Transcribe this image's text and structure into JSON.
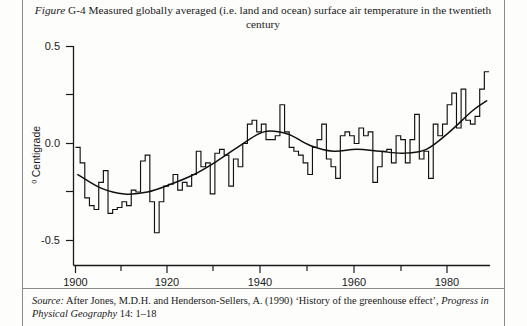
{
  "figure": {
    "label_italic": "Figure",
    "number": "G-4",
    "caption": "Measured globally averaged (i.e. land and ocean) surface air temperature in the twentieth century"
  },
  "source": {
    "lead": "Source:",
    "text_before_journal": " After Jones, M.D.H. and Henderson-Sellers, A. (1990) ‘History of the greenhouse effect’,",
    "journal": "Progress in Physical Geography",
    "text_after_journal": " 14: 1–18"
  },
  "chart_data": {
    "type": "line",
    "title": "Measured globally averaged (i.e. land and ocean) surface air temperature in the twentieth century",
    "xlabel": "",
    "ylabel": "⁰ Centigrade",
    "xlim": [
      1900,
      1989
    ],
    "ylim": [
      -0.6,
      0.5
    ],
    "grid": false,
    "legend": false,
    "x_ticks": [
      1900,
      1920,
      1940,
      1960,
      1980
    ],
    "x_tick_labels": [
      "1900",
      "1920",
      "1940",
      "1960",
      "1980"
    ],
    "x_minor_ticks": [
      1910,
      1930,
      1950,
      1970
    ],
    "y_ticks": [
      -0.5,
      0.0,
      0.5
    ],
    "y_tick_labels": [
      "-0.5",
      "0.0",
      "0.5"
    ],
    "y_minor_ticks": [
      -0.25,
      0.25
    ],
    "series": [
      {
        "name": "Annual mean temperature anomaly",
        "style": "step",
        "x": [
          1900,
          1901,
          1902,
          1903,
          1904,
          1905,
          1906,
          1907,
          1908,
          1909,
          1910,
          1911,
          1912,
          1913,
          1914,
          1915,
          1916,
          1917,
          1918,
          1919,
          1920,
          1921,
          1922,
          1923,
          1924,
          1925,
          1926,
          1927,
          1928,
          1929,
          1930,
          1931,
          1932,
          1933,
          1934,
          1935,
          1936,
          1937,
          1938,
          1939,
          1940,
          1941,
          1942,
          1943,
          1944,
          1945,
          1946,
          1947,
          1948,
          1949,
          1950,
          1951,
          1952,
          1953,
          1954,
          1955,
          1956,
          1957,
          1958,
          1959,
          1960,
          1961,
          1962,
          1963,
          1964,
          1965,
          1966,
          1967,
          1968,
          1969,
          1970,
          1971,
          1972,
          1973,
          1974,
          1975,
          1976,
          1977,
          1978,
          1979,
          1980,
          1981,
          1982,
          1983,
          1984,
          1985,
          1986,
          1987,
          1988
        ],
        "values": [
          -0.02,
          -0.1,
          -0.28,
          -0.32,
          -0.34,
          -0.2,
          -0.14,
          -0.36,
          -0.34,
          -0.33,
          -0.3,
          -0.32,
          -0.24,
          -0.25,
          -0.09,
          -0.06,
          -0.3,
          -0.46,
          -0.3,
          -0.22,
          -0.21,
          -0.16,
          -0.24,
          -0.2,
          -0.22,
          -0.16,
          -0.04,
          -0.12,
          -0.1,
          -0.26,
          -0.05,
          -0.03,
          -0.06,
          -0.22,
          -0.08,
          -0.12,
          0.0,
          0.1,
          0.12,
          0.06,
          0.1,
          0.02,
          0.02,
          0.04,
          0.2,
          0.06,
          -0.02,
          -0.04,
          -0.06,
          -0.1,
          -0.16,
          -0.02,
          0.02,
          0.1,
          -0.08,
          -0.12,
          -0.18,
          0.04,
          0.06,
          0.04,
          0.0,
          0.08,
          0.04,
          0.06,
          -0.2,
          -0.12,
          -0.04,
          -0.03,
          -0.1,
          0.04,
          0.02,
          -0.1,
          0.02,
          0.15,
          -0.08,
          -0.04,
          -0.18,
          0.1,
          0.04,
          0.1,
          0.2,
          0.26,
          0.08,
          0.28,
          0.12,
          0.1,
          0.14,
          0.28,
          0.37
        ]
      },
      {
        "name": "Smoothed trend",
        "style": "smooth",
        "x": [
          1900,
          1905,
          1910,
          1915,
          1920,
          1925,
          1930,
          1935,
          1940,
          1945,
          1950,
          1955,
          1960,
          1965,
          1970,
          1975,
          1980,
          1985,
          1988
        ],
        "values": [
          -0.16,
          -0.23,
          -0.26,
          -0.25,
          -0.21,
          -0.16,
          -0.09,
          -0.01,
          0.06,
          0.05,
          -0.01,
          -0.04,
          -0.03,
          -0.04,
          -0.05,
          -0.03,
          0.06,
          0.17,
          0.22
        ]
      }
    ]
  }
}
